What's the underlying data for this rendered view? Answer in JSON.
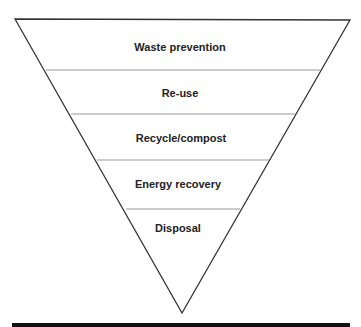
{
  "diagram": {
    "type": "inverted-pyramid",
    "tiers": [
      {
        "label": "Waste prevention"
      },
      {
        "label": "Re-use"
      },
      {
        "label": "Recycle/compost"
      },
      {
        "label": "Energy recovery"
      },
      {
        "label": "Disposal"
      }
    ],
    "colors": {
      "outline": "#333333",
      "divider": "#999999",
      "text": "#222222",
      "bar": "#111111"
    }
  }
}
